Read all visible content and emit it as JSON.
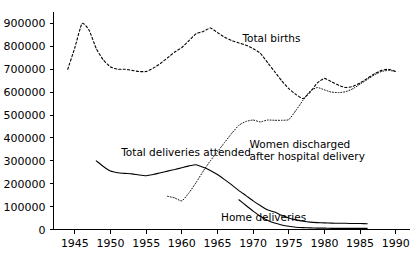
{
  "chart_data": {
    "type": "line",
    "title": "",
    "subtitle": "",
    "xlabel": "",
    "ylabel": "",
    "xlim": [
      1942,
      1992
    ],
    "ylim": [
      0,
      950000
    ],
    "grid": false,
    "legend_position": "inline-annotations",
    "x_ticks": [
      1945,
      1950,
      1955,
      1960,
      1965,
      1970,
      1975,
      1980,
      1985,
      1990
    ],
    "x_tick_labels": [
      "1945",
      "1950",
      "1955",
      "1960",
      "1965",
      "1970",
      "1975",
      "1980",
      "1985",
      "1990"
    ],
    "y_ticks": [
      0,
      100000,
      200000,
      300000,
      400000,
      500000,
      600000,
      700000,
      800000,
      900000
    ],
    "y_tick_labels": [
      "0",
      "100000",
      "200000",
      "300000",
      "400000",
      "500000",
      "600000",
      "700000",
      "800000",
      "900000"
    ],
    "series": [
      {
        "name": "Total births",
        "style": "dashed",
        "color": "#000000",
        "x": [
          1944,
          1945,
          1946,
          1947,
          1948,
          1949,
          1950,
          1951,
          1952,
          1953,
          1954,
          1955,
          1956,
          1957,
          1958,
          1959,
          1960,
          1961,
          1962,
          1963,
          1964,
          1965,
          1966,
          1967,
          1968,
          1969,
          1970,
          1971,
          1972,
          1973,
          1974,
          1975,
          1976,
          1977,
          1978,
          1979,
          1980,
          1981,
          1982,
          1983,
          1984,
          1985,
          1986,
          1987,
          1988,
          1989,
          1990
        ],
        "values": [
          700000,
          795000,
          900000,
          870000,
          790000,
          740000,
          710000,
          700000,
          700000,
          695000,
          690000,
          690000,
          705000,
          725000,
          750000,
          775000,
          795000,
          825000,
          855000,
          865000,
          880000,
          860000,
          840000,
          825000,
          815000,
          805000,
          790000,
          770000,
          730000,
          690000,
          650000,
          615000,
          590000,
          572000,
          600000,
          640000,
          660000,
          645000,
          630000,
          620000,
          625000,
          640000,
          660000,
          680000,
          695000,
          700000,
          690000
        ]
      },
      {
        "name": "Total deliveries attended",
        "style": "solid",
        "color": "#000000",
        "x": [
          1948,
          1949,
          1950,
          1951,
          1952,
          1953,
          1954,
          1955,
          1956,
          1957,
          1958,
          1959,
          1960,
          1961,
          1962,
          1963,
          1964,
          1965,
          1966,
          1967,
          1968,
          1969,
          1970,
          1971,
          1972,
          1973,
          1974,
          1975,
          1976,
          1977,
          1978,
          1979,
          1980,
          1981,
          1982,
          1983,
          1984,
          1985,
          1986
        ],
        "values": [
          300000,
          275000,
          255000,
          248000,
          245000,
          243000,
          238000,
          235000,
          240000,
          248000,
          255000,
          262000,
          270000,
          278000,
          283000,
          272000,
          258000,
          240000,
          218000,
          195000,
          170000,
          148000,
          125000,
          105000,
          86000,
          76000,
          62000,
          50000,
          42000,
          36000,
          32000,
          30000,
          29000,
          28000,
          27000,
          27000,
          26000,
          26000,
          25000
        ]
      },
      {
        "name": "Women discharged after hospital delivery",
        "style": "dotted",
        "color": "#000000",
        "x": [
          1958,
          1959,
          1960,
          1961,
          1962,
          1963,
          1964,
          1965,
          1966,
          1967,
          1968,
          1969,
          1970,
          1971,
          1972,
          1973,
          1974,
          1975,
          1976,
          1977,
          1978,
          1979,
          1980,
          1981,
          1982,
          1983,
          1984,
          1985,
          1986,
          1987,
          1988,
          1989,
          1990
        ],
        "values": [
          145000,
          138000,
          125000,
          160000,
          205000,
          255000,
          300000,
          340000,
          380000,
          420000,
          455000,
          472000,
          478000,
          470000,
          478000,
          477000,
          477000,
          480000,
          520000,
          565000,
          605000,
          620000,
          610000,
          600000,
          598000,
          602000,
          615000,
          635000,
          655000,
          675000,
          690000,
          695000,
          690000
        ]
      },
      {
        "name": "Home deliveries",
        "style": "solid",
        "color": "#000000",
        "x": [
          1968,
          1969,
          1970,
          1971,
          1972,
          1973,
          1974,
          1975,
          1976,
          1977,
          1978,
          1979,
          1980,
          1981,
          1982,
          1983,
          1984,
          1985,
          1986
        ],
        "values": [
          130000,
          105000,
          80000,
          58000,
          40000,
          28000,
          20000,
          14000,
          10000,
          8000,
          7000,
          6000,
          6000,
          5000,
          5000,
          5000,
          5000,
          5000,
          5000
        ]
      }
    ],
    "annotations": [
      {
        "id": "total-births",
        "text": "Total births",
        "x": 1968.5,
        "y": 820000,
        "lines": [
          "Total births"
        ]
      },
      {
        "id": "women-discharged",
        "text": "Women discharged after hospital delivery",
        "x": 1969.5,
        "y": 355000,
        "lines": [
          "Women discharged",
          "after hospital delivery"
        ]
      },
      {
        "id": "total-deliveries-attended",
        "text": "Total deliveries attended",
        "x": 1951.5,
        "y": 322000,
        "lines": [
          "Total deliveries attended"
        ]
      },
      {
        "id": "home-deliveries",
        "text": "Home deliveries",
        "x": 1965.5,
        "y": 38000,
        "lines": [
          "Home deliveries"
        ]
      }
    ]
  }
}
